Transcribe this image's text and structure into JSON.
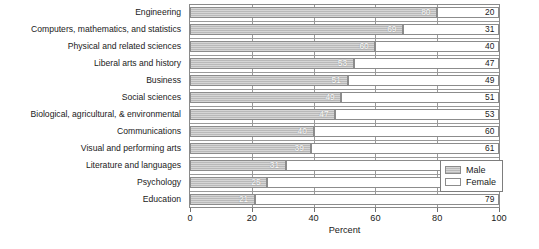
{
  "chart_data": {
    "type": "bar",
    "subtype": "stacked-horizontal-100-percent",
    "title": "",
    "xlabel": "Percent",
    "ylabel": "",
    "xlim": [
      0,
      100
    ],
    "xticks": [
      0,
      20,
      40,
      60,
      80,
      100
    ],
    "grid": true,
    "legend_position": "inside-bottom-right",
    "categories": [
      "Engineering",
      "Computers, mathematics, and statistics",
      "Physical and related sciences",
      "Liberal arts and history",
      "Business",
      "Social sciences",
      "Biological, agricultural, & environmental",
      "Communications",
      "Visual and performing arts",
      "Literature and languages",
      "Psychology",
      "Education"
    ],
    "series": [
      {
        "name": "Male",
        "color": "#b9b9b9",
        "values": [
          80,
          69,
          60,
          53,
          51,
          49,
          47,
          40,
          39,
          31,
          25,
          21
        ]
      },
      {
        "name": "Female",
        "color": "#ffffff",
        "values": [
          20,
          31,
          40,
          47,
          49,
          51,
          53,
          60,
          61,
          69,
          75,
          79
        ]
      }
    ]
  },
  "axis": {
    "x_title": "Percent",
    "tick_labels": [
      "0",
      "20",
      "40",
      "60",
      "80",
      "100"
    ]
  },
  "legend": {
    "items": [
      {
        "label": "Male"
      },
      {
        "label": "Female"
      }
    ]
  }
}
